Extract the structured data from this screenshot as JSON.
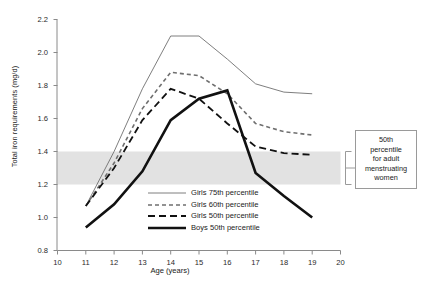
{
  "chart_data": {
    "type": "line",
    "title": "",
    "xlabel": "Age (years)",
    "ylabel": "Total iron requirements (mg/d)",
    "xlim": [
      10,
      20
    ],
    "ylim": [
      0.8,
      2.2
    ],
    "xticks": [
      "10",
      "11",
      "12",
      "13",
      "14",
      "15",
      "16",
      "17",
      "18",
      "19",
      "20"
    ],
    "yticks": [
      "0.8",
      "1.0",
      "1.2",
      "1.4",
      "1.6",
      "1.8",
      "2.0",
      "2.2"
    ],
    "grid": false,
    "legend_position": "inside-bottom-center",
    "x": [
      11,
      12,
      13,
      14,
      15,
      16,
      17,
      18,
      19
    ],
    "series": [
      {
        "name": "Girls 75th percentile",
        "style": "solid-thin",
        "color": "#6f6f6f",
        "values": [
          1.07,
          1.4,
          1.78,
          2.1,
          2.1,
          1.96,
          1.81,
          1.76,
          1.75
        ]
      },
      {
        "name": "Girls 60th percentile",
        "style": "dotted-dash",
        "color": "#6f6f6f",
        "values": [
          1.07,
          1.33,
          1.66,
          1.88,
          1.86,
          1.75,
          1.57,
          1.52,
          1.5
        ]
      },
      {
        "name": "Girls 50th percentile",
        "style": "dashed",
        "color": "#111111",
        "values": [
          1.07,
          1.3,
          1.59,
          1.78,
          1.72,
          1.57,
          1.43,
          1.39,
          1.38
        ]
      },
      {
        "name": "Boys 50th percentile",
        "style": "solid-thick",
        "color": "#111111",
        "values": [
          0.94,
          1.08,
          1.28,
          1.59,
          1.72,
          1.77,
          1.27,
          1.13,
          1.0
        ]
      }
    ],
    "shaded_band": {
      "label": "50th percentile for adult menstruating women",
      "y_min": 1.2,
      "y_max": 1.4,
      "color": "#e2e2e2"
    }
  },
  "annotation": {
    "line1": "50th",
    "line2": "percentile",
    "line3": "for adult",
    "line4": "menstruating",
    "line5": "women"
  }
}
